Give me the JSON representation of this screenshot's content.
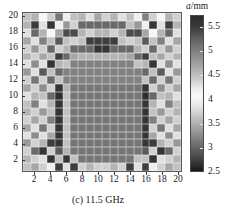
{
  "figure": {
    "caption": "(c) 11.5 GHz",
    "caption_prefix": "(c)",
    "frequency": "11.5 GHz"
  },
  "axes": {
    "x": {
      "ticks": [
        2,
        4,
        6,
        8,
        10,
        12,
        14,
        16,
        18,
        20
      ],
      "min": 0,
      "max": 20,
      "label": ""
    },
    "y": {
      "ticks": [
        2,
        4,
        6,
        8,
        10,
        12,
        14,
        16,
        18,
        20
      ],
      "min": 0,
      "max": 20,
      "label": ""
    }
  },
  "colorbar": {
    "title_symbol": "a",
    "title_unit": "/mm",
    "title": "a/mm",
    "ticks": [
      5.5,
      5,
      4.5,
      4,
      3.5,
      3,
      2.5
    ],
    "vmin": 2.5,
    "vmax": 5.75,
    "colormap": "non-monotonic-gray",
    "stops": [
      {
        "pos": 0.0,
        "color": "#2b2b2b"
      },
      {
        "pos": 0.07,
        "color": "#3a3a3a"
      },
      {
        "pos": 0.18,
        "color": "#6e6e6e"
      },
      {
        "pos": 0.3,
        "color": "#9c9c9c"
      },
      {
        "pos": 0.4,
        "color": "#c8c8c8"
      },
      {
        "pos": 0.47,
        "color": "#ededed"
      },
      {
        "pos": 0.52,
        "color": "#fafafa"
      },
      {
        "pos": 0.58,
        "color": "#e6e6e6"
      },
      {
        "pos": 0.66,
        "color": "#c0c0c0"
      },
      {
        "pos": 0.74,
        "color": "#9a9a9a"
      },
      {
        "pos": 0.82,
        "color": "#737373"
      },
      {
        "pos": 0.9,
        "color": "#4e4e4e"
      },
      {
        "pos": 0.96,
        "color": "#2e2e2e"
      },
      {
        "pos": 1.0,
        "color": "#161616"
      }
    ]
  },
  "chart_data": {
    "type": "heatmap",
    "title": "(c) 11.5 GHz",
    "xlabel": "",
    "ylabel": "",
    "zlabel": "a/mm",
    "xlim": [
      0,
      20
    ],
    "ylim": [
      0,
      20
    ],
    "zlim": [
      2.5,
      5.75
    ],
    "grid": true,
    "legend_position": "right",
    "nx": 20,
    "ny": 20,
    "x": [
      1,
      2,
      3,
      4,
      5,
      6,
      7,
      8,
      9,
      10,
      11,
      12,
      13,
      14,
      15,
      16,
      17,
      18,
      19,
      20
    ],
    "y": [
      1,
      2,
      3,
      4,
      5,
      6,
      7,
      8,
      9,
      10,
      11,
      12,
      13,
      14,
      15,
      16,
      17,
      18,
      19,
      20
    ],
    "row_order": "top_to_bottom_y20_to_y1",
    "values": [
      [
        4.5,
        4.6,
        4.1,
        4.4,
        5.1,
        4.2,
        4.5,
        4.6,
        4.3,
        4.7,
        4.4,
        4.6,
        4.3,
        4.5,
        4.2,
        5.0,
        4.4,
        4.1,
        4.6,
        4.4
      ],
      [
        4.6,
        5.5,
        4.3,
        5.6,
        4.2,
        4.8,
        4.4,
        5.2,
        5.2,
        5.2,
        5.2,
        5.2,
        5.2,
        4.5,
        4.8,
        4.2,
        5.6,
        4.3,
        5.5,
        4.6
      ],
      [
        4.3,
        5.2,
        4.6,
        4.1,
        4.7,
        5.4,
        5.4,
        4.6,
        4.4,
        4.6,
        4.6,
        4.4,
        4.6,
        5.4,
        5.4,
        4.7,
        4.1,
        4.6,
        5.2,
        4.3
      ],
      [
        4.7,
        4.3,
        5.0,
        4.5,
        5.3,
        4.5,
        4.4,
        4.5,
        5.5,
        5.5,
        5.5,
        5.5,
        4.5,
        4.4,
        4.5,
        5.3,
        4.5,
        5.0,
        4.3,
        4.7
      ],
      [
        4.4,
        4.8,
        4.4,
        5.2,
        4.4,
        4.6,
        5.2,
        5.2,
        5.2,
        5.6,
        5.6,
        5.2,
        5.2,
        5.2,
        4.6,
        4.4,
        5.2,
        4.4,
        4.8,
        4.4
      ],
      [
        4.6,
        4.4,
        4.7,
        4.5,
        5.5,
        5.2,
        4.7,
        4.6,
        4.6,
        4.6,
        4.6,
        4.6,
        4.6,
        4.7,
        5.2,
        5.5,
        4.5,
        4.7,
        4.4,
        4.6
      ],
      [
        4.3,
        4.9,
        4.3,
        5.6,
        4.6,
        4.5,
        5.0,
        5.0,
        5.0,
        5.0,
        5.0,
        5.0,
        5.0,
        5.0,
        4.5,
        4.6,
        5.6,
        4.3,
        4.9,
        4.3
      ],
      [
        4.8,
        4.3,
        5.3,
        4.5,
        5.2,
        5.0,
        5.0,
        5.0,
        5.0,
        5.0,
        5.0,
        5.0,
        5.0,
        5.0,
        5.0,
        5.2,
        4.5,
        5.3,
        4.3,
        4.8
      ],
      [
        4.4,
        5.1,
        4.4,
        5.2,
        4.5,
        5.0,
        5.0,
        5.0,
        5.0,
        5.0,
        5.0,
        5.0,
        5.0,
        5.0,
        5.0,
        4.5,
        5.2,
        4.4,
        5.1,
        4.4
      ],
      [
        4.7,
        4.4,
        4.9,
        4.4,
        5.6,
        4.6,
        5.1,
        5.1,
        5.1,
        5.1,
        5.1,
        5.1,
        5.1,
        5.1,
        5.1,
        5.6,
        4.4,
        4.9,
        4.4,
        4.7
      ],
      [
        4.3,
        4.6,
        4.5,
        5.2,
        5.7,
        4.5,
        5.1,
        5.1,
        5.1,
        5.1,
        5.1,
        5.1,
        5.1,
        5.1,
        5.1,
        5.7,
        5.2,
        4.5,
        4.6,
        4.3
      ],
      [
        4.5,
        5.0,
        4.3,
        4.6,
        5.6,
        4.5,
        5.1,
        5.1,
        5.1,
        5.1,
        5.1,
        5.1,
        5.1,
        5.1,
        5.1,
        5.6,
        4.6,
        4.3,
        5.0,
        4.5
      ],
      [
        4.6,
        4.4,
        4.8,
        4.5,
        5.6,
        4.5,
        5.1,
        5.1,
        5.1,
        5.1,
        5.1,
        5.1,
        5.1,
        5.1,
        5.1,
        5.6,
        4.5,
        4.8,
        4.4,
        4.6
      ],
      [
        4.4,
        4.7,
        4.4,
        5.0,
        5.6,
        4.5,
        5.1,
        5.1,
        5.1,
        5.1,
        5.1,
        5.1,
        5.1,
        5.1,
        5.1,
        5.6,
        5.0,
        4.4,
        4.7,
        4.4
      ],
      [
        4.7,
        4.3,
        5.1,
        4.4,
        5.6,
        4.5,
        5.1,
        5.1,
        5.1,
        5.1,
        5.1,
        5.1,
        5.1,
        5.1,
        5.1,
        5.6,
        4.4,
        5.1,
        4.3,
        4.7
      ],
      [
        4.3,
        4.9,
        4.3,
        4.7,
        5.6,
        4.5,
        5.1,
        5.1,
        5.1,
        5.1,
        5.1,
        5.1,
        5.1,
        5.1,
        5.1,
        5.6,
        4.7,
        4.3,
        4.9,
        4.3
      ],
      [
        4.8,
        4.4,
        4.6,
        5.5,
        5.6,
        4.5,
        5.1,
        5.1,
        5.1,
        5.1,
        5.1,
        5.1,
        5.1,
        5.1,
        5.1,
        5.6,
        5.5,
        4.6,
        4.4,
        4.8
      ],
      [
        4.4,
        5.2,
        5.6,
        4.4,
        5.3,
        4.6,
        5.1,
        5.1,
        5.1,
        5.1,
        5.1,
        5.1,
        5.1,
        5.1,
        5.1,
        5.3,
        4.4,
        5.6,
        5.2,
        4.4
      ],
      [
        4.6,
        4.4,
        4.3,
        5.6,
        4.5,
        5.6,
        4.5,
        5.1,
        5.1,
        5.1,
        5.1,
        5.1,
        5.1,
        5.1,
        4.5,
        4.5,
        5.6,
        4.3,
        4.4,
        4.6
      ],
      [
        4.5,
        4.7,
        4.4,
        4.2,
        5.5,
        4.3,
        5.5,
        4.4,
        4.6,
        4.4,
        4.4,
        4.6,
        4.4,
        5.5,
        4.3,
        5.5,
        4.2,
        4.4,
        4.7,
        4.5
      ]
    ]
  }
}
